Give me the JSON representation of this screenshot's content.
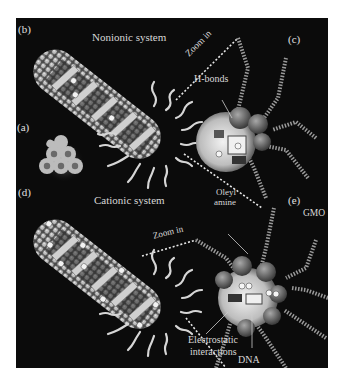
{
  "figure": {
    "background": "#0b0b0b",
    "panels": [
      {
        "id": "a",
        "label": "(a)",
        "description": "hexagonal cubosome/hexosome particle"
      },
      {
        "id": "b",
        "label": "(b)",
        "title": "Nonionic system"
      },
      {
        "id": "c",
        "label": "(c)"
      },
      {
        "id": "d",
        "label": "(d)",
        "title": "Cationic system"
      },
      {
        "id": "e",
        "label": "(e)"
      }
    ],
    "annotations": {
      "zoom_in_top": "Zoom in",
      "zoom_in_bottom": "Zoom in",
      "h_bonds": "H-bonds",
      "oleyl_amine_line1": "Oleyl",
      "oleyl_amine_line2": "amine",
      "gmo": "GMO",
      "electrostatic_line1": "Electrostatic",
      "electrostatic_line2": "interactions",
      "dna": "DNA"
    },
    "charges": {
      "negative": "−",
      "positive": "+"
    }
  }
}
